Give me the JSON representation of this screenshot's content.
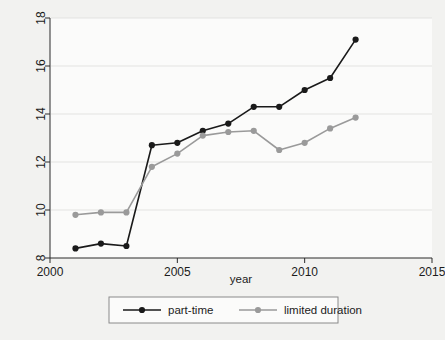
{
  "chart_data": {
    "type": "line",
    "title": "",
    "xlabel": "year",
    "ylabel": "",
    "xlim": [
      2000,
      2015
    ],
    "ylim": [
      8,
      18
    ],
    "xticks": [
      2000,
      2005,
      2010,
      2015
    ],
    "yticks": [
      8,
      10,
      12,
      14,
      16,
      18
    ],
    "grid": true,
    "legend_position": "bottom",
    "x": [
      2001,
      2002,
      2003,
      2004,
      2005,
      2006,
      2007,
      2008,
      2009,
      2010,
      2011,
      2012
    ],
    "series": [
      {
        "name": "part-time",
        "color": "#1a1a1a",
        "marker": "circle",
        "values": [
          8.4,
          8.6,
          8.5,
          12.7,
          12.8,
          13.3,
          13.6,
          14.3,
          14.3,
          15.0,
          15.5,
          17.1
        ]
      },
      {
        "name": "limited duration",
        "color": "#9a9a9a",
        "marker": "circle",
        "values": [
          9.8,
          9.9,
          9.9,
          11.8,
          12.35,
          13.1,
          13.25,
          13.3,
          12.5,
          12.8,
          13.4,
          13.85
        ]
      }
    ]
  },
  "axes": {
    "x_tick_labels": [
      "2000",
      "2005",
      "2010",
      "2015"
    ],
    "y_tick_labels": [
      "8",
      "10",
      "12",
      "14",
      "16",
      "18"
    ],
    "x_axis_title": "year"
  },
  "legend": {
    "entries": [
      {
        "label": "part-time",
        "color": "#1a1a1a"
      },
      {
        "label": "limited duration",
        "color": "#9a9a9a"
      }
    ]
  },
  "colors": {
    "series_primary": "#1a1a1a",
    "series_secondary": "#9a9a9a",
    "page_background": "#f2f2f0",
    "plot_background": "#fbfbfa",
    "axis": "#2a2a2a",
    "gridline": "#e3e3e1"
  }
}
